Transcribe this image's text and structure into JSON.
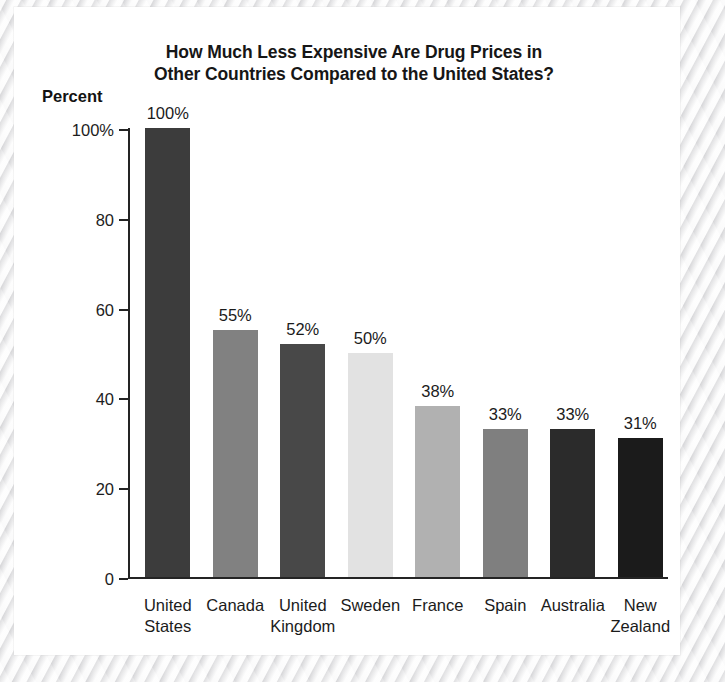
{
  "chart_data": {
    "type": "bar",
    "title": "How Much Less Expensive Are Drug Prices in Other Countries Compared to the United States?",
    "title_lines": [
      "How Much Less Expensive Are Drug Prices in",
      "Other Countries Compared to the United States?"
    ],
    "xlabel": "",
    "ylabel": "Percent",
    "ylim": [
      0,
      100
    ],
    "yticks": [
      0,
      20,
      40,
      60,
      80,
      100
    ],
    "ytick_labels": [
      "0",
      "20",
      "40",
      "60",
      "80",
      "100%"
    ],
    "grid": false,
    "legend": "none",
    "categories": [
      "United States",
      "Canada",
      "United Kingdom",
      "Sweden",
      "France",
      "Spain",
      "Australia",
      "New Zealand"
    ],
    "category_lines": [
      [
        "United",
        "States"
      ],
      [
        "Canada",
        ""
      ],
      [
        "United",
        "Kingdom"
      ],
      [
        "Sweden",
        ""
      ],
      [
        "France",
        ""
      ],
      [
        "Spain",
        ""
      ],
      [
        "Australia",
        ""
      ],
      [
        "New",
        "Zealand"
      ]
    ],
    "values": [
      100,
      55,
      52,
      50,
      38,
      33,
      33,
      31
    ],
    "value_labels": [
      "100%",
      "55%",
      "52%",
      "50%",
      "38%",
      "33%",
      "33%",
      "31%"
    ],
    "bar_colors": [
      "#3c3c3c",
      "#818181",
      "#484848",
      "#e2e2e2",
      "#b1b1b1",
      "#7f7f7f",
      "#2b2b2b",
      "#1b1b1b"
    ],
    "axis_color": "#242424",
    "text_color": "#1b1b1b",
    "panel_background": "#ffffff",
    "page_background": "#ebebec"
  }
}
